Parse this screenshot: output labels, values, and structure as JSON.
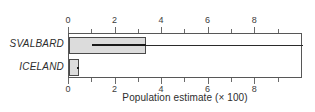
{
  "chart_data": {
    "type": "bar",
    "plot_style": "horizontal-boxplot",
    "title": "",
    "subtitle": "",
    "xlabel": "Population estimate (× 100)",
    "ylabel": "",
    "xlim": [
      0,
      10.05
    ],
    "ylim": [
      0,
      2
    ],
    "grid": false,
    "legend": null,
    "x_major_ticks": [
      0,
      2,
      4,
      6,
      8
    ],
    "x_minor_ticks": [
      1,
      3,
      5,
      7,
      9
    ],
    "x_tick_labels": [
      "0",
      "2",
      "4",
      "6",
      "8"
    ],
    "axis_labels_top": true,
    "axis_labels_bottom": true,
    "categories": [
      "SVALBARD",
      "ICELAND"
    ],
    "values": [
      3.3,
      0.42
    ],
    "series": [
      {
        "name": "Population estimate",
        "values": [
          3.3,
          0.42
        ]
      }
    ],
    "boxes": [
      {
        "category": "SVALBARD",
        "box_min": 0.0,
        "box_max": 3.3,
        "median": 1.0,
        "whisker_low": 0.0,
        "whisker_high": 10.05
      },
      {
        "category": "ICELAND",
        "box_min": 0.0,
        "box_max": 0.42,
        "median": 0.33,
        "whisker_low": 0.0,
        "whisker_high": 0.42
      }
    ],
    "colors": {
      "box_fill": "#dcdcdc",
      "box_edge": "#4a4a4a",
      "median": "#1a1a1a",
      "whisker": "#2b2b2b",
      "frame": "#575757",
      "text": "#2d2d2d",
      "background": "#ffffff"
    }
  }
}
